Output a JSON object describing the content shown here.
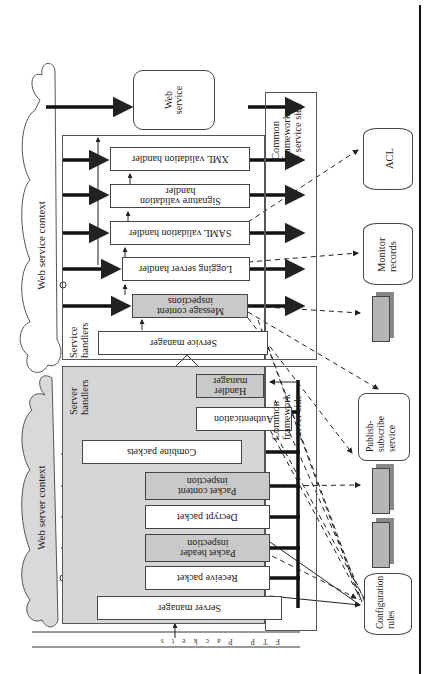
{
  "diagram": {
    "clouds": {
      "web_service_context": "Web service context",
      "web_server_context": "Web server context"
    },
    "service_side": {
      "group_label": "Service\nhandlers",
      "web_service": "Web\nservice",
      "handlers": [
        {
          "label": "XML validation handler",
          "shaded": false
        },
        {
          "label": "Signature validation\nhandler",
          "shaded": false
        },
        {
          "label": "SAML validation handler",
          "shaded": false
        },
        {
          "label": "Logging server handler",
          "shaded": false
        },
        {
          "label": "Message content\ninspections",
          "shaded": true
        }
      ],
      "manager": "Service manager",
      "framework": "Common\nframework\n– service side"
    },
    "server_side": {
      "group_label": "Server\nhandlers",
      "handler_manager": "Handler\nmanager",
      "authentication": "Authentication",
      "combine": "Combine packets",
      "handlers": [
        {
          "label": "Packet content\ninspection",
          "shaded": true
        },
        {
          "label": "Decrypt packet",
          "shaded": false
        },
        {
          "label": "Packet header\ninspection",
          "shaded": true
        },
        {
          "label": "Receive packet",
          "shaded": false
        }
      ],
      "manager": "Server manager",
      "framework": "Common\nframework\nserver side"
    },
    "stores": {
      "acl": "ACL",
      "monitor": "Monitor\nrecords",
      "publish_subscribe": "Publish-\nsubscribe\nservice",
      "configuration": "Configuration\nrules"
    },
    "input_label": "F T P   P a c k e t s"
  },
  "colors": {
    "line": "#222222",
    "shaded_box": "#c9c9c9",
    "server_panel": "#d6d6d6",
    "cloud_gray": "#d9d9d9"
  }
}
